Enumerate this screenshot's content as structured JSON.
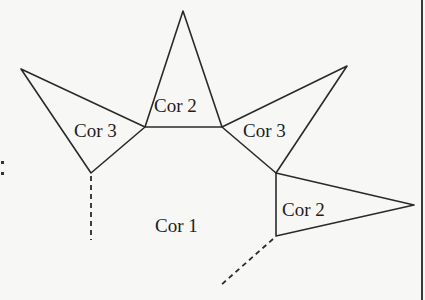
{
  "diagram": {
    "type": "colored regions / map coloring figure",
    "regions": [
      {
        "id": "center",
        "label": "Cor 1"
      },
      {
        "id": "top-triangle",
        "label": "Cor 2"
      },
      {
        "id": "left-triangle",
        "label": "Cor 3"
      },
      {
        "id": "right-upper-triangle",
        "label": "Cor 3"
      },
      {
        "id": "right-lower-triangle",
        "label": "Cor 2"
      }
    ],
    "left_marker": ":",
    "colors": {
      "line": "#2a2a2a",
      "background": "#f7f7f6"
    }
  }
}
